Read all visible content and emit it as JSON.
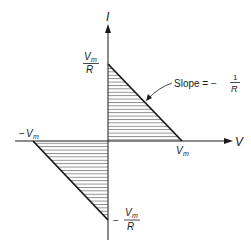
{
  "diagram": {
    "type": "I-V characteristic (load line regions)",
    "axes": {
      "x_label": "V",
      "y_label": "I"
    },
    "labels": {
      "vm_pos_num": "V",
      "vm_sub": "m",
      "r_den": "R",
      "neg_sign": "−",
      "slope_text": "Slope = −",
      "slope_num": "1",
      "slope_den": "R"
    },
    "points": {
      "upper_intercept": "Vm/R",
      "right_intercept": "Vm",
      "left_intercept": "-Vm",
      "lower_intercept": "-Vm/R"
    },
    "annotation": "Slope = -1/R",
    "colors": {
      "line": "#1a1a1a",
      "hatch": "#555555",
      "background": "#ffffff"
    }
  }
}
